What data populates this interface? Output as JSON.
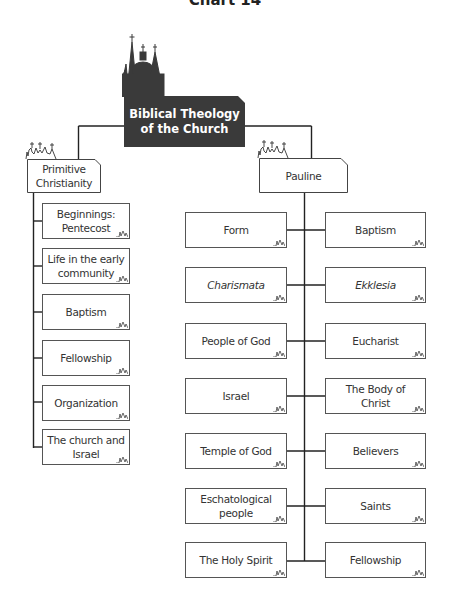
{
  "title": "Chart 14",
  "root": {
    "label_line1": "Biblical Theology",
    "label_line2": "of the Church",
    "fill_color": "#3a3a3a",
    "text_color": "#ffffff"
  },
  "branches": {
    "primitive": {
      "label_line1": "Primitive",
      "label_line2": "Christianity",
      "items": [
        {
          "line1": "Beginnings:",
          "line2": "Pentecost"
        },
        {
          "line1": "Life in the early",
          "line2": "community"
        },
        {
          "line1": "Baptism",
          "line2": ""
        },
        {
          "line1": "Fellowship",
          "line2": ""
        },
        {
          "line1": "Organization",
          "line2": ""
        },
        {
          "line1": "The church and",
          "line2": "Israel"
        }
      ]
    },
    "pauline": {
      "label": "Pauline",
      "left_items": [
        {
          "line1": "Form",
          "line2": ""
        },
        {
          "line1": "Charismata",
          "line2": "",
          "italic": true
        },
        {
          "line1": "People of God",
          "line2": ""
        },
        {
          "line1": "Israel",
          "line2": ""
        },
        {
          "line1": "Temple of God",
          "line2": ""
        },
        {
          "line1": "Eschatological",
          "line2": "people"
        },
        {
          "line1": "The Holy Spirit",
          "line2": ""
        }
      ],
      "right_items": [
        {
          "line1": "Baptism",
          "line2": ""
        },
        {
          "line1": "Ekklesia",
          "line2": "",
          "italic": true
        },
        {
          "line1": "Eucharist",
          "line2": ""
        },
        {
          "line1": "The Body of",
          "line2": "Christ"
        },
        {
          "line1": "Believers",
          "line2": ""
        },
        {
          "line1": "Saints",
          "line2": ""
        },
        {
          "line1": "Fellowship",
          "line2": ""
        }
      ]
    }
  },
  "icons": {
    "church": "church-silhouette-icon",
    "box_mark": "church-mini-icon"
  }
}
